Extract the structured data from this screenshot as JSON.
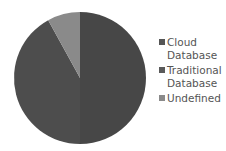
{
  "chart_data": {
    "type": "pie",
    "title": "",
    "labels": [
      "Cloud Database",
      "Traditional Database",
      "Undefined"
    ],
    "values": [
      50,
      42,
      8
    ],
    "colors": [
      "#474747",
      "#4d4d4d",
      "#8a8a8a"
    ],
    "start_angle_deg": 0,
    "direction": "clockwise",
    "legend_position": "right"
  },
  "legend": {
    "items": [
      {
        "label": "Cloud\nDatabase",
        "color": "#555555"
      },
      {
        "label": "Traditional\nDatabase",
        "color": "#5a5a5a"
      },
      {
        "label": "Undefined",
        "color": "#8a8a8a"
      }
    ]
  }
}
